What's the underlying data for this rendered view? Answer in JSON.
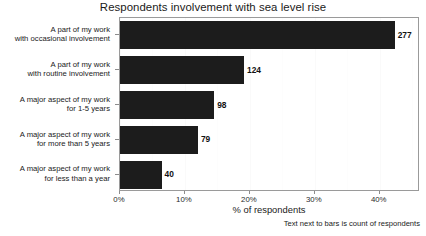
{
  "chart_data": {
    "type": "bar",
    "orientation": "horizontal",
    "title": "Respondents involvement with sea level rise",
    "xlabel": "% of respondents",
    "ylabel": "",
    "caption": "Text next to bars is count of respondents",
    "categories": [
      "A part of my work\nwith occasional involvement",
      "A part of my work\nwith routine involvement",
      "A major aspect of my work\nfor 1-5 years",
      "A major aspect of my work\nfor more than 5 years",
      "A major aspect of my work\nfor less than a year"
    ],
    "category_lines": [
      [
        "A part of my work",
        "with occasional involvement"
      ],
      [
        "A part of my work",
        "with routine involvement"
      ],
      [
        "A major aspect of my work",
        "for 1-5 years"
      ],
      [
        "A major aspect of my work",
        "for more than 5 years"
      ],
      [
        "A major aspect of my work",
        "for less than a year"
      ]
    ],
    "values": [
      42.3,
      19.1,
      14.5,
      12.0,
      6.4
    ],
    "counts": [
      277,
      124,
      98,
      79,
      40
    ],
    "count_labels": [
      "277",
      "124",
      "98",
      "79",
      "40"
    ],
    "xlim": [
      0,
      46.2
    ],
    "xticks": [
      0,
      10,
      20,
      30,
      40
    ],
    "xtick_labels": [
      "0%",
      "10%",
      "20%",
      "30%",
      "40%"
    ],
    "grid": true,
    "legend": null,
    "bar_color": "#1c1c1c",
    "panel_border_color": "#9a9a9a",
    "background_color": "#ffffff"
  }
}
